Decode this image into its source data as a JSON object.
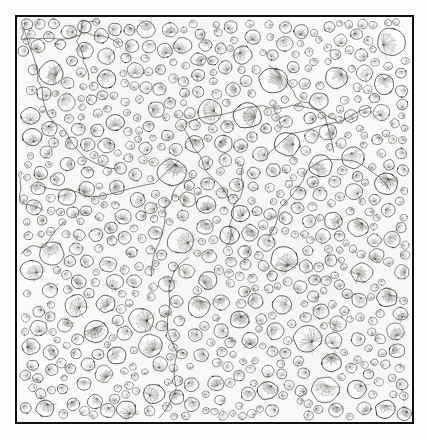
{
  "plate": {
    "title": "Starch granules",
    "subject": "starch-granules",
    "technique": "engraving",
    "caption": "",
    "background_color": "#fdfdfc",
    "paper_color": "#fbfbf9",
    "ink_color": "#2b2724",
    "frame": {
      "border_color": "#111010",
      "border_width_px": 2,
      "x": 15,
      "y": 15,
      "width": 399,
      "height": 409
    }
  },
  "chart_data": {
    "type": "scatter",
    "subtitle": "",
    "xlabel": "",
    "ylabel": "",
    "xlim": [
      0,
      395
    ],
    "ylim": [
      0,
      405
    ],
    "grid": false,
    "legend": null,
    "annotations": [],
    "tick_labels": {
      "x": [],
      "y": []
    },
    "point_count": 640,
    "radius_range": [
      3.2,
      15.0
    ],
    "fill_tone": "#ffffff",
    "outline_tone": "#342f2b",
    "hatch_tone": "#5a534d",
    "filament_count": 14,
    "series": [
      {
        "name": "granules",
        "marker": "striated-round-granule",
        "values": []
      },
      {
        "name": "filaments",
        "marker": "thin-curved-hair",
        "values": []
      }
    ]
  }
}
